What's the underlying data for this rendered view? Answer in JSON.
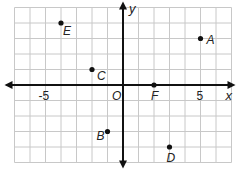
{
  "chart_data": {
    "type": "scatter",
    "title": "",
    "xlabel": "x",
    "ylabel": "y",
    "origin_label": "O",
    "xlim": [
      -7,
      7
    ],
    "ylim": [
      -5,
      5
    ],
    "grid": true,
    "tick_labels": [
      {
        "value": -5,
        "text": "-5"
      },
      {
        "value": 5,
        "text": "5"
      }
    ],
    "points": [
      {
        "name": "A",
        "x": 5,
        "y": 3
      },
      {
        "name": "B",
        "x": -1,
        "y": -3
      },
      {
        "name": "C",
        "x": -2,
        "y": 1
      },
      {
        "name": "D",
        "x": 3,
        "y": -4
      },
      {
        "name": "E",
        "x": -4,
        "y": 4
      },
      {
        "name": "F",
        "x": 2,
        "y": 0
      }
    ]
  },
  "colors": {
    "grid": "#c8c8c8",
    "axis": "#111111",
    "point": "#111111"
  }
}
